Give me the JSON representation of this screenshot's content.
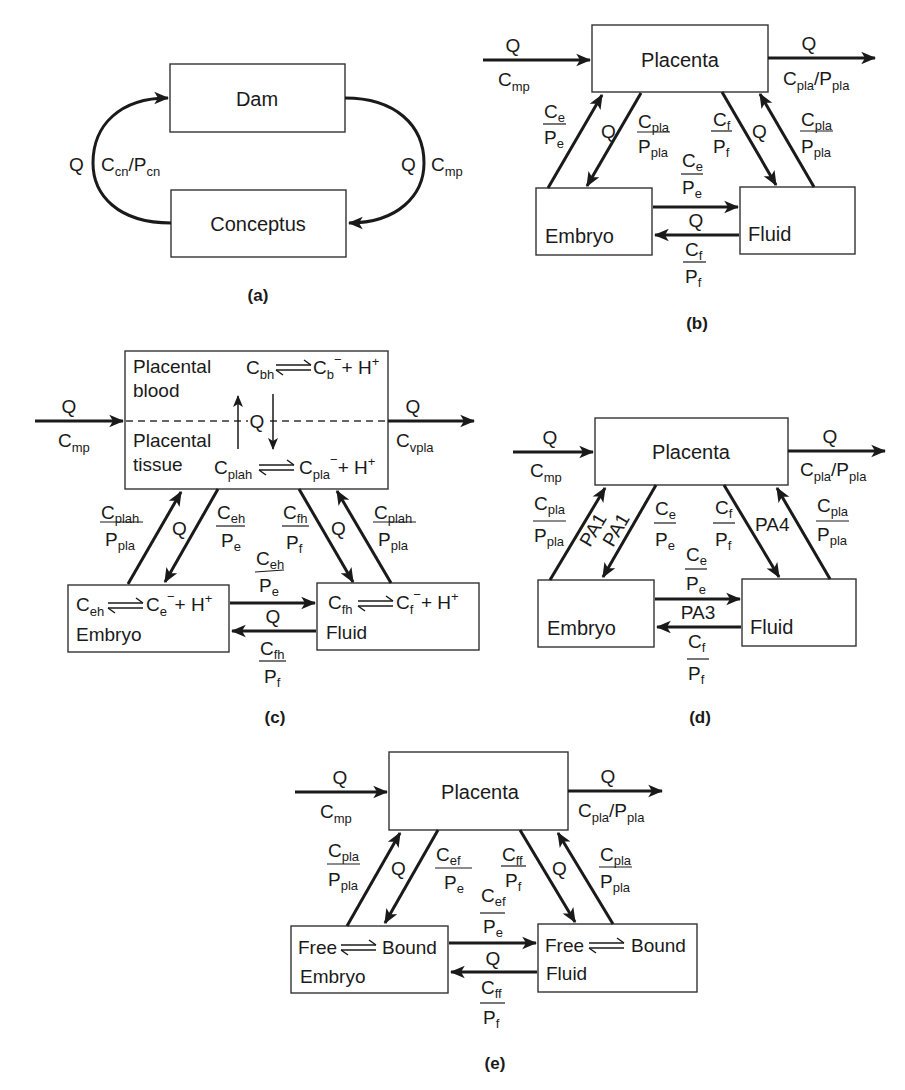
{
  "panels": {
    "a": {
      "caption": "(a)",
      "boxes": {
        "top": "Dam",
        "bottom": "Conceptus"
      },
      "left_arc": {
        "flow": "Q",
        "conc": "C",
        "conc_sub": "cn",
        "slash": "/P",
        "p_sub": "cn"
      },
      "right_arc": {
        "flow": "Q",
        "conc": "C",
        "conc_sub": "mp"
      }
    },
    "b": {
      "caption": "(b)",
      "boxes": {
        "top": "Placenta",
        "left": "Embryo",
        "right": "Fluid"
      },
      "inflow": {
        "flow": "Q",
        "conc": "C",
        "conc_sub": "mp"
      },
      "outflow": {
        "flow": "Q",
        "conc": "C",
        "conc_sub": "pla",
        "slash": "/P",
        "p_sub": "pla"
      },
      "left_up": {
        "num": "C",
        "num_sub": "e",
        "den": "P",
        "den_sub": "e"
      },
      "left_q": "Q",
      "left_down": {
        "num": "C",
        "num_sub": "pla",
        "den": "P",
        "den_sub": "pla"
      },
      "right_down": {
        "num": "C",
        "num_sub": "f",
        "den": "P",
        "den_sub": "f"
      },
      "right_q": "Q",
      "right_up": {
        "num": "C",
        "num_sub": "pla",
        "den": "P",
        "den_sub": "pla"
      },
      "mid_top": {
        "num": "C",
        "num_sub": "e",
        "den": "P",
        "den_sub": "e"
      },
      "mid_q": "Q",
      "mid_bottom": {
        "num": "C",
        "num_sub": "f",
        "den": "P",
        "den_sub": "f"
      }
    },
    "c": {
      "caption": "(c)",
      "top_box": {
        "blood_label_1": "Placental",
        "blood_label_2": "blood",
        "tissue_label_1": "Placental",
        "tissue_label_2": "tissue",
        "blood_eq": {
          "left": "C",
          "left_sub": "bh",
          "right": "C",
          "right_sub": "b",
          "charge": "−",
          "tail": "+ H",
          "tail_sup": "+"
        },
        "tissue_eq": {
          "left": "C",
          "left_sub": "plah",
          "right": "C",
          "right_sub": "pla",
          "charge": "−",
          "tail": "+ H",
          "tail_sup": "+"
        },
        "exchange_q": "Q"
      },
      "inflow": {
        "flow": "Q",
        "conc": "C",
        "conc_sub": "mp"
      },
      "outflow": {
        "flow": "Q",
        "conc": "C",
        "conc_sub": "vpla"
      },
      "embryo_box": {
        "name": "Embryo",
        "eq": {
          "left": "C",
          "left_sub": "eh",
          "right": "C",
          "right_sub": "e",
          "charge": "−",
          "tail": "+ H",
          "tail_sup": "+"
        }
      },
      "fluid_box": {
        "name": "Fluid",
        "eq": {
          "left": "C",
          "left_sub": "fh",
          "right": "C",
          "right_sub": "f",
          "charge": "−",
          "tail": "+ H",
          "tail_sup": "+"
        }
      },
      "left_up": {
        "num": "C",
        "num_sub": "plah",
        "den": "P",
        "den_sub": "pla"
      },
      "left_q": "Q",
      "left_down": {
        "num": "C",
        "num_sub": "eh",
        "den": "P",
        "den_sub": "e"
      },
      "right_down": {
        "num": "C",
        "num_sub": "fh",
        "den": "P",
        "den_sub": "f"
      },
      "right_q": "Q",
      "right_up": {
        "num": "C",
        "num_sub": "plah",
        "den": "P",
        "den_sub": "pla"
      },
      "mid_top": {
        "num": "C",
        "num_sub": "eh",
        "den": "P",
        "den_sub": "e"
      },
      "mid_q": "Q",
      "mid_bottom": {
        "num": "C",
        "num_sub": "fh",
        "den": "P",
        "den_sub": "f"
      }
    },
    "d": {
      "caption": "(d)",
      "boxes": {
        "top": "Placenta",
        "left": "Embryo",
        "right": "Fluid"
      },
      "inflow": {
        "flow": "Q",
        "conc": "C",
        "conc_sub": "mp"
      },
      "outflow": {
        "flow": "Q",
        "conc": "C",
        "conc_sub": "pla",
        "slash": "/P",
        "p_sub": "pla"
      },
      "left_up": {
        "num": "C",
        "num_sub": "pla",
        "den": "P",
        "den_sub": "pla"
      },
      "left_up_pa": "PA1",
      "left_down_pa": "PA1",
      "left_down": {
        "num": "C",
        "num_sub": "e",
        "den": "P",
        "den_sub": "e"
      },
      "right_down": {
        "num": "C",
        "num_sub": "f",
        "den": "P",
        "den_sub": "f"
      },
      "right_pa": "PA4",
      "right_up": {
        "num": "C",
        "num_sub": "pla",
        "den": "P",
        "den_sub": "pla"
      },
      "mid_top": {
        "num": "C",
        "num_sub": "e",
        "den": "P",
        "den_sub": "e"
      },
      "mid_pa": "PA3",
      "mid_bottom": {
        "num": "C",
        "num_sub": "f",
        "den": "P",
        "den_sub": "f"
      }
    },
    "e": {
      "caption": "(e)",
      "top_box": "Placenta",
      "embryo_box": {
        "free": "Free",
        "bound": "Bound",
        "name": "Embryo"
      },
      "fluid_box": {
        "free": "Free",
        "bound": "Bound",
        "name": "Fluid"
      },
      "inflow": {
        "flow": "Q",
        "conc": "C",
        "conc_sub": "mp"
      },
      "outflow": {
        "flow": "Q",
        "conc": "C",
        "conc_sub": "pla",
        "slash": "/P",
        "p_sub": "pla"
      },
      "left_up": {
        "num": "C",
        "num_sub": "pla",
        "den": "P",
        "den_sub": "pla"
      },
      "left_q": "Q",
      "left_down": {
        "num": "C",
        "num_sub": "ef",
        "den": "P",
        "den_sub": "e"
      },
      "right_down": {
        "num": "C",
        "num_sub": "ff",
        "den": "P",
        "den_sub": "f"
      },
      "right_q": "Q",
      "right_up": {
        "num": "C",
        "num_sub": "pla",
        "den": "P",
        "den_sub": "pla"
      },
      "mid_top": {
        "num": "C",
        "num_sub": "ef",
        "den": "P",
        "den_sub": "e"
      },
      "mid_q": "Q",
      "mid_bottom": {
        "num": "C",
        "num_sub": "ff",
        "den": "P",
        "den_sub": "f"
      }
    }
  },
  "colors": {
    "ink": "#1a1a1a",
    "box_stroke": "#333333",
    "background": "#ffffff"
  }
}
